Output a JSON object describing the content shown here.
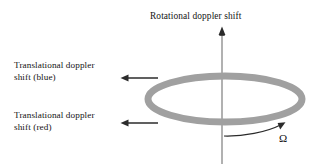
{
  "figure": {
    "title": "Rotational doppler shift",
    "background_color": "#ffffff",
    "text_color": "#141414"
  },
  "axis": {
    "name": "rotational-axis",
    "orientation": "vertical",
    "color": "#9e9e9e",
    "arrowhead_color": "#2b2b2b",
    "label": "Rotational doppler shift"
  },
  "ring": {
    "name": "rotating-ring",
    "shape": "ellipse",
    "color": "#a0a0a0",
    "cx": 225,
    "cy": 99,
    "rx": 77,
    "ry": 23,
    "stroke_width": 7
  },
  "arrows": [
    {
      "name": "translational-arrow-blue",
      "label": "Translational doppler\nshift (blue)",
      "direction": "left",
      "color": "#2b2b2b",
      "x_start": 158,
      "x_end": 122,
      "y": 78
    },
    {
      "name": "translational-arrow-red",
      "label": "Translational doppler\nshift (red)",
      "direction": "left",
      "color": "#2b2b2b",
      "x_start": 158,
      "x_end": 122,
      "y": 123
    }
  ],
  "rotation": {
    "name": "rotation-direction-arrow",
    "symbol": "Ω",
    "description": "curved arrow indicating angular velocity",
    "color": "#2b2b2b"
  }
}
